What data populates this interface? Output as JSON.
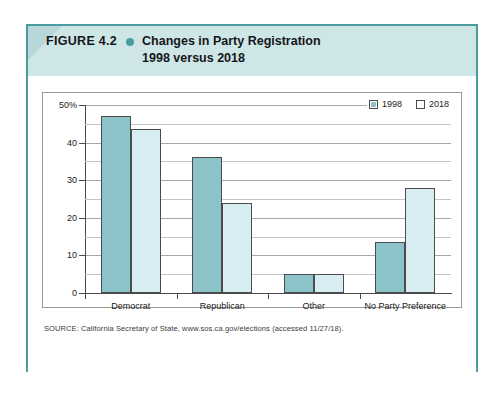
{
  "figure": {
    "label": "FIGURE 4.2",
    "bullet_icon": "bullet-dot",
    "title": "Changes in Party Registration\n1998 versus 2018",
    "source": "SOURCE: California Secretary of State, www.sos.ca.gov/elections (accessed 11/27/18).",
    "frame_color": "#4a9ca0",
    "header_color": "#cfe6e7"
  },
  "chart_data": {
    "type": "bar",
    "title": "Changes in Party Registration 1998 versus 2018",
    "xlabel": "",
    "ylabel": "",
    "categories": [
      "Democrat",
      "Republican",
      "Other",
      "No Party Preference"
    ],
    "series": [
      {
        "name": "1998",
        "color": "#8cc3c8",
        "values": [
          47.0,
          36.3,
          5.0,
          13.7
        ]
      },
      {
        "name": "2018",
        "color": "#d7edf1",
        "values": [
          43.5,
          24.0,
          5.0,
          27.8
        ]
      }
    ],
    "ylim": [
      0,
      50
    ],
    "yticks": [
      0,
      10,
      20,
      30,
      40,
      50
    ],
    "ytick_labels": [
      "0",
      "10",
      "20",
      "30",
      "40",
      "50%"
    ],
    "minor_tick_step": 5,
    "grid": true,
    "legend_position": "top-right"
  }
}
